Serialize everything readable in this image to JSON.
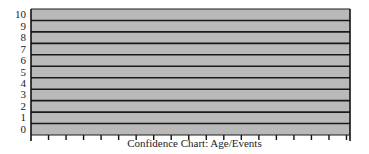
{
  "chart_data": {
    "type": "bar",
    "title": "Confidence Chart: Age/Events",
    "xlabel": "Confidence Chart: Age/Events",
    "ylabel": "",
    "ylim": [
      0,
      10
    ],
    "yticks": [
      "0",
      "1",
      "2",
      "3",
      "4",
      "5",
      "6",
      "7",
      "8",
      "9",
      "10"
    ],
    "x_tick_count": 18,
    "categories": [],
    "values": [],
    "grid": true,
    "legend": null
  },
  "colors": {
    "band_fill": "#b9b9b9",
    "grid_line": "#1a1a1a",
    "axis": "#111111",
    "background": "#ffffff"
  }
}
